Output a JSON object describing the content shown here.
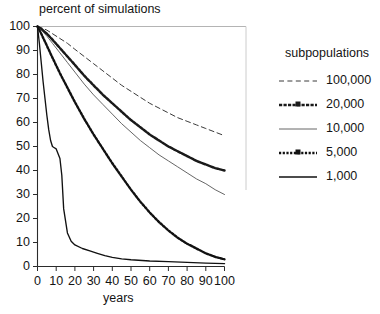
{
  "chart_data": {
    "type": "line",
    "title": "percent of simulations",
    "xlabel": "years",
    "ylabel": "",
    "xlim": [
      0,
      100
    ],
    "ylim": [
      0,
      100
    ],
    "xticks": [
      0,
      10,
      20,
      30,
      40,
      50,
      60,
      70,
      80,
      90,
      100
    ],
    "yticks": [
      0,
      10,
      20,
      30,
      40,
      50,
      60,
      70,
      80,
      90,
      100
    ],
    "grid": false,
    "legend_position": "right",
    "legend_title": "subpopulations",
    "series": [
      {
        "name": "100,000",
        "style": "dashed",
        "color": "#333333",
        "x": [
          0,
          2,
          5,
          8,
          12,
          16,
          20,
          25,
          30,
          35,
          40,
          45,
          50,
          55,
          60,
          65,
          70,
          75,
          80,
          85,
          90,
          95,
          100
        ],
        "values": [
          100,
          99.5,
          98.5,
          97,
          95,
          93,
          90.5,
          87.5,
          84.5,
          81.5,
          78.5,
          75.5,
          73,
          70.5,
          68,
          66,
          64,
          62,
          60.5,
          59,
          57.5,
          56,
          54.5
        ]
      },
      {
        "name": "20,000",
        "style": "dash-dot-thick",
        "color": "#1a1a1a",
        "x": [
          0,
          2,
          5,
          8,
          12,
          16,
          20,
          25,
          30,
          35,
          40,
          45,
          50,
          55,
          60,
          65,
          70,
          75,
          80,
          85,
          90,
          95,
          100
        ],
        "values": [
          100,
          99,
          97,
          94.5,
          91,
          87.5,
          84,
          79.5,
          75.5,
          71.5,
          68,
          64.5,
          61,
          58,
          55,
          52.5,
          50,
          48,
          46,
          44,
          42.5,
          41,
          40
        ]
      },
      {
        "name": "10,000",
        "style": "solid-thin",
        "color": "#555555",
        "x": [
          0,
          2,
          5,
          8,
          12,
          16,
          20,
          25,
          30,
          35,
          40,
          45,
          50,
          55,
          60,
          65,
          70,
          75,
          80,
          85,
          90,
          95,
          100
        ],
        "values": [
          100,
          98.5,
          96,
          93,
          89,
          85,
          81,
          76,
          71.5,
          67.5,
          63.5,
          59.5,
          56,
          52.5,
          49.5,
          46.5,
          44,
          41.5,
          39,
          36.5,
          34.5,
          32,
          30
        ]
      },
      {
        "name": "5,000",
        "style": "dotted-thick",
        "color": "#111111",
        "x": [
          0,
          2,
          5,
          8,
          12,
          16,
          20,
          25,
          30,
          35,
          40,
          45,
          50,
          55,
          60,
          65,
          70,
          75,
          80,
          85,
          90,
          95,
          100
        ],
        "values": [
          100,
          97,
          92,
          87,
          80.5,
          74.5,
          68.5,
          61.5,
          55,
          49,
          43,
          37.5,
          32,
          27,
          22.5,
          18.5,
          15,
          12,
          9.5,
          7.5,
          5.5,
          4,
          3
        ]
      },
      {
        "name": "1,000",
        "style": "solid-bold",
        "color": "#111111",
        "x": [
          0,
          1,
          2,
          3,
          4,
          5,
          6,
          7,
          8,
          9,
          10,
          11,
          12,
          13,
          14,
          16,
          18,
          20,
          24,
          28,
          32,
          36,
          40,
          45,
          50,
          60,
          70,
          80,
          90,
          100
        ],
        "values": [
          100,
          93,
          85,
          77,
          70,
          63,
          57,
          52.5,
          50,
          49.5,
          49,
          47,
          45,
          38,
          24,
          14,
          10.5,
          9,
          7.5,
          6.5,
          5.5,
          4.5,
          3.8,
          3.2,
          2.8,
          2.3,
          2,
          1.7,
          1.4,
          1.2
        ]
      }
    ]
  },
  "axes": {
    "yticks": [
      "100",
      "90",
      "80",
      "70",
      "60",
      "50",
      "40",
      "30",
      "20",
      "10",
      "0"
    ],
    "xticks": [
      "0",
      "10",
      "20",
      "30",
      "40",
      "50",
      "60",
      "70",
      "80",
      "90",
      "100"
    ]
  },
  "legend": {
    "title": "subpopulations",
    "items": [
      {
        "label": "100,000",
        "sample": "dashed-line-sample"
      },
      {
        "label": "20,000",
        "sample": "dash-dot-line-sample"
      },
      {
        "label": "10,000",
        "sample": "thin-solid-line-sample"
      },
      {
        "label": "5,000",
        "sample": "dotted-thick-line-sample"
      },
      {
        "label": "1,000",
        "sample": "bold-solid-line-sample"
      }
    ]
  },
  "caption": ""
}
